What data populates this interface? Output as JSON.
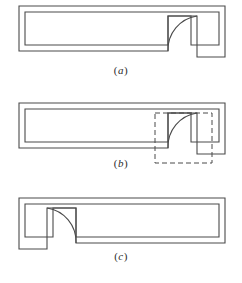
{
  "document": {
    "title": "Mirror command illustration",
    "background_color": "#ffffff",
    "line_color": "#4a4a4a",
    "dash_color": "#4a4a4a"
  },
  "figures": [
    {
      "id": "a",
      "caption": "(a)",
      "caption_open": "(",
      "caption_letter": "a",
      "caption_close": ")",
      "description": "wall-section-with-door-swing-right",
      "door_side": "right",
      "has_selection_box": false,
      "geometry": {
        "outer": "M19,6 L225,6 L225,57 L197,57 L197,16 L168,16 L168,51 L19,51 Z",
        "inner_left": 25,
        "inner_top": 12,
        "inner_bottom": 45,
        "inner_right": 191,
        "arc_start_x": 168,
        "arc_start_y": 51,
        "arc_end_x": 197,
        "arc_end_y": 16,
        "arc_radius": 34
      }
    },
    {
      "id": "b",
      "caption": "(b)",
      "caption_open": "(",
      "caption_letter": "b",
      "caption_close": ")",
      "description": "wall-section-with-door-swing-right-and-selection-window",
      "door_side": "right",
      "has_selection_box": true,
      "selection_box": {
        "x": 155,
        "y": 113,
        "width": 57,
        "height": 50,
        "style": "dashed"
      }
    },
    {
      "id": "c",
      "caption": "(c)",
      "caption_open": "(",
      "caption_letter": "c",
      "caption_close": ")",
      "description": "wall-section-with-door-swing-mirrored-to-left",
      "door_side": "left",
      "has_selection_box": false
    }
  ]
}
